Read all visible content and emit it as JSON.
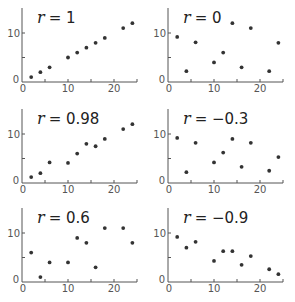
{
  "chart_data": [
    {
      "type": "scatter",
      "title": "r = 1",
      "r_symbol": "r",
      "r_value": "= 1",
      "xlabel": "",
      "ylabel": "",
      "xlim": [
        0,
        25
      ],
      "ylim": [
        0,
        15
      ],
      "xticks": [
        0,
        10,
        20
      ],
      "yticks": [
        0,
        10
      ],
      "grid": false,
      "x": [
        2,
        4,
        6,
        10,
        12,
        14,
        16,
        18,
        22,
        24
      ],
      "y": [
        1,
        2,
        3,
        5,
        6,
        7,
        8,
        9,
        11,
        12
      ]
    },
    {
      "type": "scatter",
      "title": "r = 0",
      "r_symbol": "r",
      "r_value": "= 0",
      "xlabel": "",
      "ylabel": "",
      "xlim": [
        0,
        25
      ],
      "ylim": [
        0,
        15
      ],
      "xticks": [
        0,
        10,
        20
      ],
      "yticks": [
        0,
        10
      ],
      "grid": false,
      "x": [
        2,
        4,
        6,
        10,
        12,
        14,
        16,
        18,
        22,
        24
      ],
      "y": [
        9.2,
        2.2,
        8.1,
        4,
        6,
        12,
        3,
        11,
        2.2,
        8
      ]
    },
    {
      "type": "scatter",
      "title": "r = 0.98",
      "r_symbol": "r",
      "r_value": "= 0.98",
      "xlabel": "",
      "ylabel": "",
      "xlim": [
        0,
        25
      ],
      "ylim": [
        0,
        15
      ],
      "xticks": [
        0,
        10,
        20
      ],
      "yticks": [
        0,
        10
      ],
      "grid": false,
      "x": [
        2,
        4,
        6,
        10,
        12,
        14,
        16,
        18,
        22,
        24
      ],
      "y": [
        1.2,
        2,
        4.2,
        4.1,
        6,
        8,
        7.5,
        9,
        11,
        12
      ]
    },
    {
      "type": "scatter",
      "title": "r = −0.3",
      "r_symbol": "r",
      "r_value": "= −0.3",
      "xlabel": "",
      "ylabel": "",
      "xlim": [
        0,
        25
      ],
      "ylim": [
        0,
        15
      ],
      "xticks": [
        0,
        10,
        20
      ],
      "yticks": [
        0,
        10
      ],
      "grid": false,
      "x": [
        2,
        4,
        6,
        10,
        12,
        14,
        16,
        18,
        22,
        24
      ],
      "y": [
        9.2,
        2.2,
        8.2,
        4.2,
        6.2,
        9,
        3.3,
        8.2,
        2.5,
        5.3
      ]
    },
    {
      "type": "scatter",
      "title": "r = 0.6",
      "r_symbol": "r",
      "r_value": "= 0.6",
      "xlabel": "",
      "ylabel": "",
      "xlim": [
        0,
        25
      ],
      "ylim": [
        0,
        15
      ],
      "xticks": [
        0,
        10,
        20
      ],
      "yticks": [
        0,
        10
      ],
      "grid": false,
      "x": [
        2,
        4,
        6,
        10,
        12,
        14,
        16,
        18,
        22,
        24
      ],
      "y": [
        6,
        1,
        4,
        4,
        9,
        8,
        3,
        11,
        11,
        8
      ]
    },
    {
      "type": "scatter",
      "title": "r = −0.9",
      "r_symbol": "r",
      "r_value": "= −0.9",
      "xlabel": "",
      "ylabel": "",
      "xlim": [
        0,
        25
      ],
      "ylim": [
        0,
        15
      ],
      "xticks": [
        0,
        10,
        20
      ],
      "yticks": [
        0,
        10
      ],
      "grid": false,
      "x": [
        2,
        4,
        6,
        10,
        12,
        14,
        16,
        18,
        22,
        24
      ],
      "y": [
        9.2,
        7,
        8.2,
        4.3,
        6.3,
        6.3,
        3.5,
        5.3,
        2.6,
        1.6
      ]
    }
  ],
  "style": {
    "axis_color": "#555555",
    "point_color": "#333333",
    "text_color": "#222222"
  }
}
